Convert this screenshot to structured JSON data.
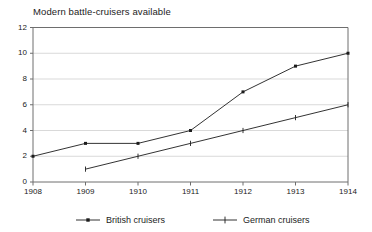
{
  "chart_data": {
    "type": "line",
    "title": "Modern battle-cruisers available",
    "xlabel": "",
    "ylabel": "",
    "x": [
      1908,
      1909,
      1910,
      1911,
      1912,
      1913,
      1914
    ],
    "xtick_labels": [
      "1908",
      "1909",
      "1910",
      "1911",
      "1912",
      "1913",
      "1914"
    ],
    "ytick_labels": [
      "0",
      "2",
      "4",
      "6",
      "8",
      "10",
      "12"
    ],
    "yticks": [
      0,
      2,
      4,
      6,
      8,
      10,
      12
    ],
    "xlim": [
      1908,
      1914
    ],
    "ylim": [
      0,
      12
    ],
    "grid": "horizontal",
    "legend_position": "bottom",
    "series": [
      {
        "name": "British cruisers",
        "marker": "square-dot",
        "color": "#1c1c1c",
        "x": [
          1908,
          1909,
          1910,
          1911,
          1912,
          1913,
          1914
        ],
        "values": [
          2,
          3,
          3,
          4,
          7,
          9,
          10
        ]
      },
      {
        "name": "German cruisers",
        "marker": "plus",
        "color": "#1c1c1c",
        "x": [
          1909,
          1910,
          1911,
          1912,
          1913,
          1914
        ],
        "values": [
          1,
          2,
          3,
          4,
          5,
          6
        ]
      }
    ]
  },
  "legend": {
    "entries": [
      {
        "label": "British cruisers"
      },
      {
        "label": "German cruisers"
      }
    ]
  },
  "colors": {
    "line": "#1c1c1c",
    "grid": "#d9d9d9",
    "axis": "#6e6e6e",
    "text": "#1c1c1c",
    "background": "#ffffff"
  }
}
